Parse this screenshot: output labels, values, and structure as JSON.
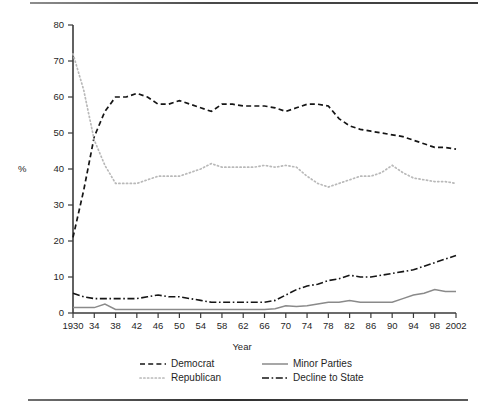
{
  "figure": {
    "ylabel": "%",
    "xlabel": "Year",
    "top_rule": "horizontal-rule",
    "bottom_rule": "horizontal-rule"
  },
  "legend": {
    "position": "below-axes",
    "entries": [
      {
        "label": "Democrat",
        "style": "dashed",
        "color": "#151515",
        "icon": "dashed-line-icon"
      },
      {
        "label": "Republican",
        "style": "dotted",
        "color": "#b9b9b9",
        "icon": "dotted-line-icon"
      },
      {
        "label": "Minor Parties",
        "style": "solid",
        "color": "#8a8a8a",
        "icon": "solid-line-icon"
      },
      {
        "label": "Decline to State",
        "style": "dashdot",
        "color": "#151515",
        "icon": "dash-dot-line-icon"
      }
    ]
  },
  "chart_data": {
    "type": "line",
    "title": "",
    "xlabel": "Year",
    "ylabel": "%",
    "xlim": [
      1930,
      2002
    ],
    "ylim": [
      0,
      80
    ],
    "grid": false,
    "legend_position": "bottom",
    "x": [
      1930,
      1932,
      1934,
      1936,
      1938,
      1940,
      1942,
      1944,
      1946,
      1948,
      1950,
      1952,
      1954,
      1956,
      1958,
      1960,
      1962,
      1964,
      1966,
      1968,
      1970,
      1972,
      1974,
      1976,
      1978,
      1980,
      1982,
      1984,
      1986,
      1988,
      1990,
      1992,
      1994,
      1996,
      1998,
      2000,
      2002
    ],
    "xtick_labels": [
      "1930",
      "34",
      "38",
      "42",
      "46",
      "50",
      "54",
      "58",
      "62",
      "66",
      "70",
      "74",
      "78",
      "82",
      "86",
      "90",
      "94",
      "98",
      "2002"
    ],
    "xtick_values": [
      1930,
      1934,
      1938,
      1942,
      1946,
      1950,
      1954,
      1958,
      1962,
      1966,
      1970,
      1974,
      1978,
      1982,
      1986,
      1990,
      1994,
      1998,
      2002
    ],
    "ytick_values": [
      0,
      10,
      20,
      30,
      40,
      50,
      60,
      70,
      80
    ],
    "ytick_labels": [
      "0",
      "10",
      "20",
      "30",
      "40",
      "50",
      "60",
      "70",
      "80"
    ],
    "series": [
      {
        "name": "Democrat",
        "style": "dashed",
        "color": "#151515",
        "values": [
          21,
          34,
          49,
          56,
          60,
          60,
          61,
          60,
          58,
          58,
          59,
          58,
          57,
          56,
          58,
          58,
          57.5,
          57.5,
          57.5,
          57,
          56,
          57,
          58,
          58,
          57.5,
          54,
          52,
          51,
          50.5,
          50,
          49.5,
          49,
          48,
          47,
          46,
          46,
          45.5
        ]
      },
      {
        "name": "Republican",
        "style": "dotted",
        "color": "#b9b9b9",
        "values": [
          72,
          62,
          48,
          41,
          36,
          36,
          36,
          37,
          38,
          38,
          38,
          39,
          40,
          41.5,
          40.5,
          40.5,
          40.5,
          40.5,
          41,
          40.5,
          41,
          40.5,
          38,
          36,
          35,
          36,
          37,
          38,
          38,
          39,
          41,
          39,
          37.5,
          37,
          36.5,
          36.5,
          36
        ]
      },
      {
        "name": "Minor Parties",
        "style": "solid",
        "color": "#8a8a8a",
        "values": [
          1.5,
          1.5,
          1.5,
          2.5,
          1,
          1,
          1,
          1,
          1,
          1,
          1,
          1,
          1,
          1,
          1,
          1,
          1,
          1,
          1,
          1.2,
          2,
          1.8,
          2,
          2.5,
          3,
          3,
          3.5,
          3,
          3,
          3,
          3,
          4,
          5,
          5.5,
          6.5,
          6,
          6
        ]
      },
      {
        "name": "Decline to State",
        "style": "dashdot",
        "color": "#151515",
        "values": [
          5.5,
          4.5,
          4,
          4,
          4,
          4,
          4,
          4.5,
          5,
          4.5,
          4.5,
          4,
          3.5,
          3,
          3,
          3,
          3,
          3,
          3,
          3.5,
          5,
          6.5,
          7.5,
          8,
          9,
          9.5,
          10.5,
          10,
          10,
          10.5,
          11,
          11.5,
          12,
          13,
          14,
          15,
          16
        ]
      }
    ]
  }
}
